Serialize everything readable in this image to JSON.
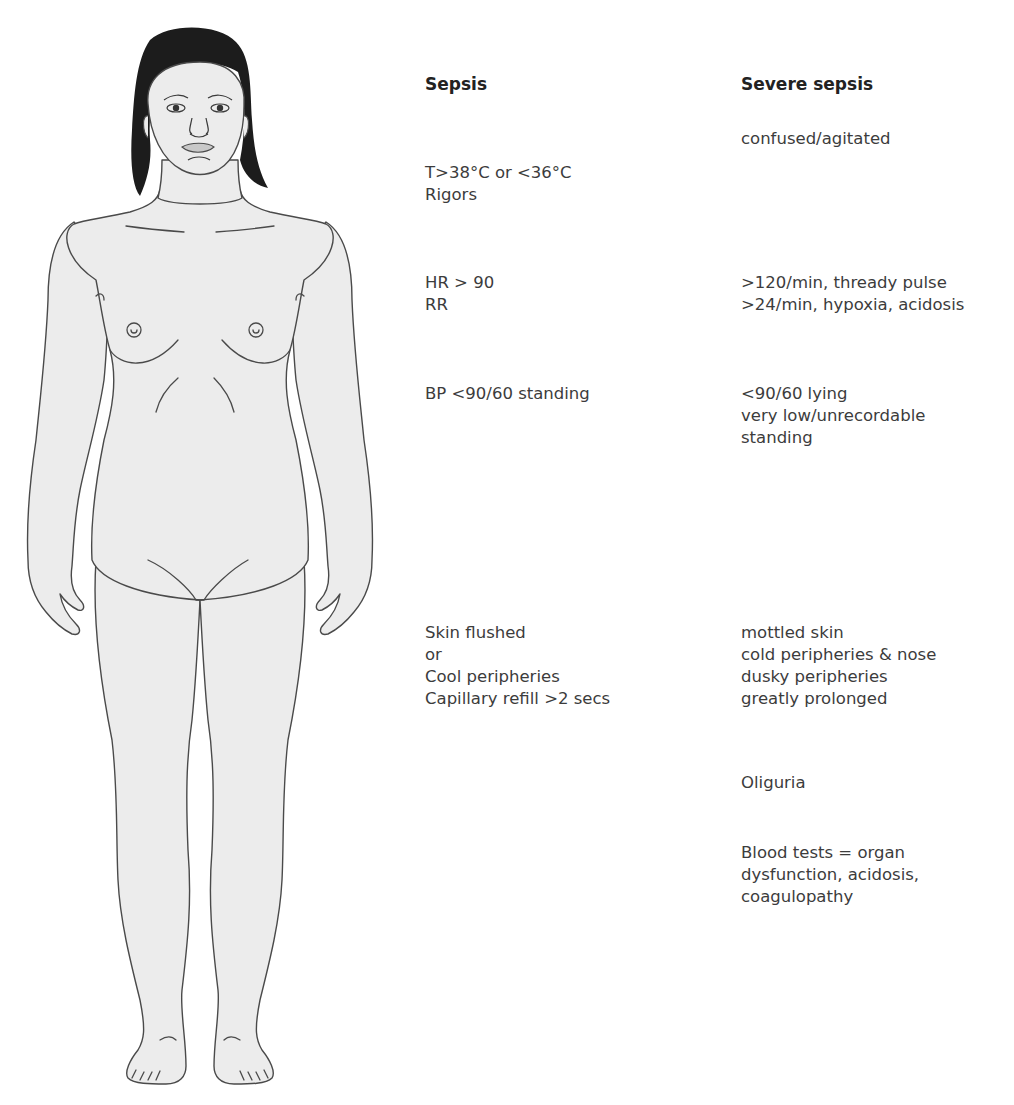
{
  "figure": {
    "colors": {
      "skin": "#ececec",
      "outline": "#4a4a4a",
      "hair": "#1c1c1c",
      "lips": "#c8c8c8"
    }
  },
  "columns": [
    {
      "title": "Sepsis",
      "groups": [
        {
          "region": "temperature",
          "lines": [
            "T>38°C or <36°C",
            "Rigors"
          ]
        },
        {
          "region": "heart-respiratory",
          "lines": [
            "HR > 90",
            "RR"
          ]
        },
        {
          "region": "blood-pressure",
          "lines": [
            "BP <90/60 standing"
          ]
        },
        {
          "region": "skin",
          "lines": [
            "Skin flushed",
            "or",
            "Cool peripheries",
            "Capillary refill >2 secs"
          ]
        }
      ]
    },
    {
      "title": "Severe sepsis",
      "groups": [
        {
          "region": "mental-state",
          "lines": [
            "confused/agitated"
          ]
        },
        {
          "region": "heart-respiratory",
          "lines": [
            ">120/min, thready pulse",
            ">24/min, hypoxia, acidosis"
          ]
        },
        {
          "region": "blood-pressure",
          "lines": [
            "<90/60 lying",
            "very low/unrecordable",
            "standing"
          ]
        },
        {
          "region": "skin",
          "lines": [
            "mottled skin",
            "cold peripheries & nose",
            "dusky peripheries",
            "greatly prolonged"
          ]
        },
        {
          "region": "urine",
          "lines": [
            "Oliguria"
          ]
        },
        {
          "region": "blood-tests",
          "lines": [
            "Blood tests = organ",
            "dysfunction, acidosis,",
            "coagulopathy"
          ]
        }
      ]
    }
  ]
}
